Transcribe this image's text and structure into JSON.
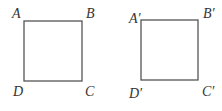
{
  "figures": [
    {
      "name": "square-ABCD",
      "rect": {
        "x": 24,
        "y": 21,
        "w": 58,
        "h": 60
      },
      "labels": [
        {
          "text": "A",
          "x": 12,
          "y": 18
        },
        {
          "text": "B",
          "x": 86,
          "y": 18
        },
        {
          "text": "C",
          "x": 85,
          "y": 96
        },
        {
          "text": "D",
          "x": 13,
          "y": 96
        }
      ]
    },
    {
      "name": "square-A'B'C'D'",
      "rect": {
        "x": 141,
        "y": 20,
        "w": 57,
        "h": 60
      },
      "labels": [
        {
          "text": "A′",
          "x": 129,
          "y": 23
        },
        {
          "text": "B′",
          "x": 203,
          "y": 18
        },
        {
          "text": "C′",
          "x": 202,
          "y": 96
        },
        {
          "text": "D′",
          "x": 129,
          "y": 98
        }
      ]
    }
  ],
  "colors": {
    "stroke": "#555555",
    "text": "#333333",
    "background": "#ffffff"
  }
}
